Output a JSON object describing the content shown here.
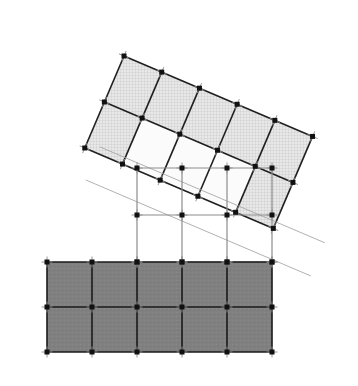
{
  "figure": {
    "title": "Overlapping finite element meshes",
    "width": 358,
    "height": 386,
    "background_color": "#ffffff"
  },
  "colors": {
    "page_background": "#ffffff",
    "dark_mesh_fill": "#808080",
    "dark_mesh_edge": "#1a1a1a",
    "light_mesh_fill": "#e3e3e3",
    "light_mesh_edge": "#1f1f1f",
    "hatch_line": "#b4b4b4",
    "node_color": "#111111",
    "tick_color": "#8c8c8c",
    "interface_grid": "#8c8c8c",
    "ghost_line": "#a8a8a8"
  },
  "meshes": [
    {
      "name": "rotated-upper-mesh",
      "label": "Upper rotated mesh",
      "cells_x": 5,
      "cells_y": 2,
      "nodes_x": 6,
      "nodes_y": 3,
      "rotation_deg": 23.1,
      "origin": {
        "x": 124,
        "y": 56
      },
      "cell_width": 41.0,
      "cell_height": 50.0,
      "fill": "#e3e3e3",
      "hatched": true,
      "edge_width": 1.6
    },
    {
      "name": "horizontal-lower-mesh",
      "label": "Lower horizontal mesh",
      "cells_x": 5,
      "cells_y": 2,
      "nodes_x": 6,
      "nodes_y": 3,
      "rotation_deg": 0,
      "origin": {
        "x": 47,
        "y": 262
      },
      "cell_width": 45.0,
      "cell_height": 45.0,
      "fill": "#808080",
      "hatched": false,
      "edge_width": 1.6
    },
    {
      "name": "interface-grid",
      "label": "Interface connection grid",
      "cells_x": 3,
      "cells_y": 2,
      "nodes_x": 4,
      "nodes_y": 3,
      "rotation_deg": 0,
      "origin": {
        "x": 137,
        "y": 168
      },
      "cell_width": 45.0,
      "cell_height": 47.0,
      "fill": "none",
      "hatched": false,
      "edge_width": 1.2
    }
  ],
  "node_style": {
    "shape": "square",
    "size": 5,
    "color": "#111111",
    "tick_length": 11,
    "tick_color": "#8c8c8c",
    "tick_width": 0.9
  },
  "ghost_lines": {
    "label": "Projected mesh boundary lines",
    "color": "#a8a8a8",
    "width": 0.9,
    "count": 2
  }
}
